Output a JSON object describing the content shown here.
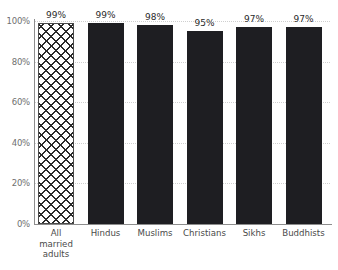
{
  "chart_data": {
    "type": "bar",
    "title": "",
    "subtitle": "",
    "xlabel": "",
    "ylabel": "",
    "categories": [
      "All married adults",
      "Hindus",
      "Muslims",
      "Christians",
      "Sikhs",
      "Buddhists"
    ],
    "values": [
      99,
      99,
      98,
      95,
      97,
      97
    ],
    "data_labels": [
      "99%",
      "99%",
      "98%",
      "95%",
      "97%",
      "97%"
    ],
    "ylim": [
      0,
      100
    ],
    "ytick_labels": [
      "0%",
      "20%",
      "40%",
      "60%",
      "80%",
      "100%"
    ],
    "ytick_values": [
      0,
      20,
      40,
      60,
      80,
      100
    ],
    "grid": true,
    "legend": "none",
    "series": [
      {
        "name": "",
        "values": [
          99,
          99,
          98,
          95,
          97,
          97
        ]
      }
    ],
    "bar_styles": [
      "hatched",
      "solid",
      "solid",
      "solid",
      "solid",
      "solid"
    ],
    "colors": {
      "bar_solid": "#1e1e22",
      "bar_hatch_line": "#2a2a2a",
      "bar_hatch_fill": "#ffffff",
      "axis": "#8d8d8d",
      "gridline": "#cfcfcf",
      "tick_label": "#6f6f6f",
      "category_label": "#4a4a4a",
      "value_label": "#2b2b2b",
      "background": "#ffffff"
    }
  }
}
